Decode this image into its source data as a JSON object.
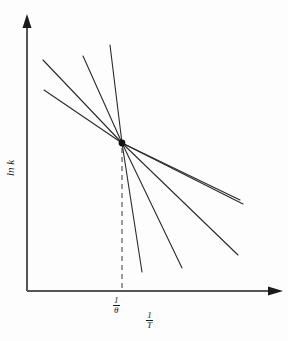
{
  "figure": {
    "background_color": "#fdfdfd",
    "ink_color": "#1a1a1a"
  },
  "axes": {
    "y": {
      "label_text": "ln k",
      "label_parts": {
        "function": "ln",
        "variable": "k"
      },
      "arrowhead": "up",
      "origin_px": [
        27,
        291
      ],
      "top_px": [
        27,
        18
      ]
    },
    "x": {
      "label_numerator": "1",
      "label_denominator": "T",
      "arrowhead": "right",
      "origin_px": [
        27,
        291
      ],
      "right_px": [
        281,
        291
      ]
    }
  },
  "ticks": {
    "x": [
      {
        "name": "isokinetic-temperature",
        "numerator": "1",
        "denominator": "θ",
        "position_px": 122
      }
    ]
  },
  "annotations": {
    "dashed_dropline": {
      "name": "isokinetic-dropline",
      "from_px": [
        122,
        146
      ],
      "to_px": [
        122,
        291
      ],
      "style": "dashed"
    },
    "convergence_point": {
      "name": "isokinetic-point",
      "position_px": [
        122,
        143
      ],
      "marker": "filled-dot"
    }
  },
  "chart_data": {
    "type": "line",
    "title": "",
    "xlabel": "1/T",
    "ylabel": "ln k",
    "grid": false,
    "legend": "none",
    "xlim": [
      27,
      281
    ],
    "ylim": [
      291,
      18
    ],
    "axis_units": "pixels",
    "intersection": {
      "x": 122,
      "y": 143
    },
    "series": [
      {
        "name": "line-1",
        "x": [
          44,
          122
        ],
        "y": [
          90,
          143
        ],
        "slope_sign": "negative",
        "steepness": "shallow"
      },
      {
        "name": "line-2",
        "x": [
          43,
          122
        ],
        "y": [
          60,
          143
        ],
        "slope_sign": "negative",
        "steepness": "moderate"
      },
      {
        "name": "line-3",
        "x": [
          83,
          122
        ],
        "y": [
          56,
          143
        ],
        "slope_sign": "negative",
        "steepness": "steep"
      },
      {
        "name": "line-4",
        "x": [
          110,
          122
        ],
        "y": [
          45,
          143
        ],
        "slope_sign": "negative",
        "steepness": "very-steep"
      },
      {
        "name": "line-5",
        "x": [
          122,
          142
        ],
        "y": [
          143,
          272
        ],
        "slope_sign": "negative",
        "steepness": "very-steep"
      },
      {
        "name": "line-6",
        "x": [
          122,
          182
        ],
        "y": [
          143,
          268
        ],
        "slope_sign": "negative",
        "steepness": "steep"
      },
      {
        "name": "line-7",
        "x": [
          122,
          238
        ],
        "y": [
          143,
          255
        ],
        "slope_sign": "negative",
        "steepness": "moderate"
      },
      {
        "name": "line-8",
        "x": [
          122,
          243
        ],
        "y": [
          143,
          204
        ],
        "slope_sign": "negative",
        "steepness": "shallow"
      },
      {
        "name": "line-9",
        "x": [
          122,
          240
        ],
        "y": [
          143,
          200
        ],
        "slope_sign": "negative",
        "steepness": "shallow"
      }
    ]
  }
}
